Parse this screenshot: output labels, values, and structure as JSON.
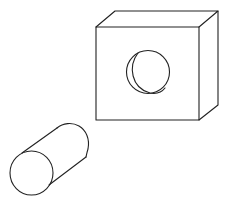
{
  "diagram": {
    "type": "line-drawing",
    "description": "Cylindrical peg beside a rectangular block with a circular hole",
    "stroke_color": "#222222",
    "background": "#ffffff",
    "objects": [
      {
        "name": "block",
        "shape": "rectangular-prism",
        "front_face": {
          "x1": 96,
          "y1": 27,
          "x2": 199,
          "y2": 120
        },
        "back_offset": {
          "dx": 19,
          "dy": -16
        },
        "hole": {
          "cx": 148,
          "cy": 72,
          "r": 21
        }
      },
      {
        "name": "peg",
        "shape": "cylinder",
        "front_end": {
          "cx": 31.5,
          "cy": 173,
          "rx": 21.5,
          "ry": 22
        },
        "back_end": {
          "cx": 67,
          "cy": 146,
          "rx": 21,
          "ry": 21
        }
      }
    ]
  }
}
